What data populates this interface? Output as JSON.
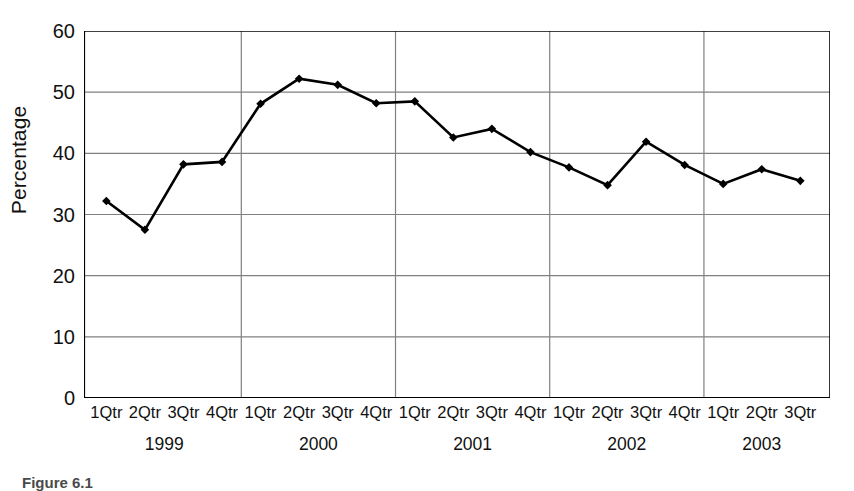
{
  "chart_data": {
    "type": "line",
    "title": "",
    "xlabel": "",
    "ylabel": "Percentage",
    "ylim": [
      0,
      60
    ],
    "ytick_step": 10,
    "yticks": [
      0,
      10,
      20,
      30,
      40,
      50,
      60
    ],
    "grid": "horizontal-and-year-dividers",
    "legend": "none",
    "marker": "diamond",
    "line_color": "#000000",
    "grid_color": "#808080",
    "axis_color": "#000000",
    "categories": [
      "1Qtr",
      "2Qtr",
      "3Qtr",
      "4Qtr",
      "1Qtr",
      "2Qtr",
      "3Qtr",
      "4Qtr",
      "1Qtr",
      "2Qtr",
      "3Qtr",
      "4Qtr",
      "1Qtr",
      "2Qtr",
      "3Qtr",
      "4Qtr",
      "1Qtr",
      "2Qtr",
      "3Qtr"
    ],
    "values": [
      32.2,
      27.5,
      38.2,
      38.6,
      48.1,
      52.2,
      51.2,
      48.2,
      48.5,
      42.6,
      44.0,
      40.2,
      37.7,
      34.8,
      41.9,
      38.1,
      35.0,
      37.4,
      35.5
    ],
    "group_labels": [
      "1999",
      "2000",
      "2001",
      "2002",
      "2003"
    ],
    "group_spans": [
      4,
      4,
      4,
      4,
      3
    ],
    "points": [
      {
        "period": "1Qtr 1999",
        "value": 32.2
      },
      {
        "period": "2Qtr 1999",
        "value": 27.5
      },
      {
        "period": "3Qtr 1999",
        "value": 38.2
      },
      {
        "period": "4Qtr 1999",
        "value": 38.6
      },
      {
        "period": "1Qtr 2000",
        "value": 48.1
      },
      {
        "period": "2Qtr 2000",
        "value": 52.2
      },
      {
        "period": "3Qtr 2000",
        "value": 51.2
      },
      {
        "period": "4Qtr 2000",
        "value": 48.2
      },
      {
        "period": "1Qtr 2001",
        "value": 48.5
      },
      {
        "period": "2Qtr 2001",
        "value": 42.6
      },
      {
        "period": "3Qtr 2001",
        "value": 44.0
      },
      {
        "period": "4Qtr 2001",
        "value": 40.2
      },
      {
        "period": "1Qtr 2002",
        "value": 37.7
      },
      {
        "period": "2Qtr 2002",
        "value": 34.8
      },
      {
        "period": "3Qtr 2002",
        "value": 41.9
      },
      {
        "period": "4Qtr 2002",
        "value": 38.1
      },
      {
        "period": "1Qtr 2003",
        "value": 35.0
      },
      {
        "period": "2Qtr 2003",
        "value": 37.4
      },
      {
        "period": "3Qtr 2003",
        "value": 35.5
      }
    ]
  },
  "caption": {
    "text": "Figure 6.1"
  }
}
